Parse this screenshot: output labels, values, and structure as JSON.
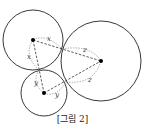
{
  "figure": {
    "caption": "[그림 2]",
    "colors": {
      "stroke": "#222222",
      "dash": "#555555",
      "background": "#ffffff"
    },
    "circles": [
      {
        "name": "circle-top-left",
        "cx": 33,
        "cy": 40,
        "r": 30
      },
      {
        "name": "circle-bottom",
        "cx": 44,
        "cy": 93,
        "r": 23
      },
      {
        "name": "circle-right",
        "cx": 101,
        "cy": 61,
        "r": 40
      }
    ],
    "centers": [
      {
        "name": "center-top-left",
        "x": 33,
        "y": 40
      },
      {
        "name": "center-bottom",
        "x": 44,
        "y": 93
      },
      {
        "name": "center-right",
        "x": 101,
        "y": 61
      }
    ],
    "tangent_points": [
      {
        "name": "tangent-top-bottom",
        "x": 39,
        "y": 70
      },
      {
        "name": "tangent-top-right",
        "x": 62,
        "y": 49
      },
      {
        "name": "tangent-bottom-right",
        "x": 66,
        "y": 82
      }
    ],
    "labels": [
      {
        "name": "label-x-top",
        "text": "x",
        "x": 47,
        "y": 40
      },
      {
        "name": "label-x-left",
        "text": "x",
        "x": 27,
        "y": 58
      },
      {
        "name": "label-y-left",
        "text": "y",
        "x": 34,
        "y": 84
      },
      {
        "name": "label-y-bottom",
        "text": "y",
        "x": 55,
        "y": 96
      },
      {
        "name": "label-z-top",
        "text": "z",
        "x": 83,
        "y": 51
      },
      {
        "name": "label-z-bottom",
        "text": "z",
        "x": 88,
        "y": 81
      }
    ]
  }
}
